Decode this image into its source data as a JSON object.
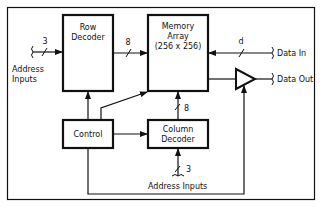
{
  "diagram": {
    "blocks": {
      "row_decoder": [
        "Row",
        "Decoder"
      ],
      "memory_array": [
        "Memory",
        "Array",
        "(256 x 256)"
      ],
      "control": [
        "Control"
      ],
      "column_decoder": [
        "Column",
        "Decoder"
      ]
    },
    "bus_widths": {
      "address_in": "3",
      "row_to_array": "8",
      "data_in": "d",
      "column_to_array": "8",
      "column_address": "3"
    },
    "labels": {
      "address_inputs_left": [
        "Address",
        "Inputs"
      ],
      "address_inputs_bottom": "Address Inputs",
      "data_in": "Data In",
      "data_out": "Data Out"
    },
    "colors": {
      "stroke": "#111111",
      "background": "#ffffff"
    }
  }
}
